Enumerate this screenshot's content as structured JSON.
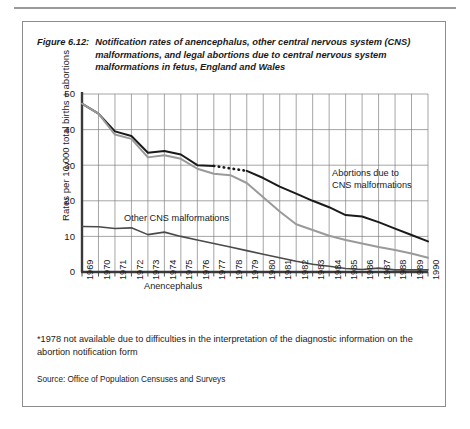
{
  "figure": {
    "label": "Figure 6.12:",
    "caption": "Notification rates of anencephalus, other central nervous system (CNS) malformations, and legal abortions due to central nervous system malformations in fetus, England and Wales",
    "footnote": "*1978 not available due to difficulties in the interpretation of the diagnostic information on the abortion notification form",
    "source": "Source: Office of Population Censuses and Surveys"
  },
  "chart_data": {
    "type": "line",
    "title": "Notification rates of anencephalus, other central nervous system (CNS) malformations, and legal abortions due to central nervous system malformations in fetus, England and Wales",
    "xlabel": "",
    "ylabel": "Rates per 10,000 total births + abortions",
    "x": [
      1969,
      1970,
      1971,
      1972,
      1973,
      1974,
      1975,
      1976,
      1977,
      1978,
      1979,
      1980,
      1981,
      1982,
      1983,
      1984,
      1985,
      1986,
      1987,
      1988,
      1989,
      1990
    ],
    "xtick_labels": [
      "1969",
      "1970",
      "1971",
      "1972",
      "1973",
      "1974",
      "1975",
      "1976",
      "1977",
      "1978",
      "1979",
      "1980",
      "1981",
      "1982",
      "1983",
      "1984",
      "1985",
      "1986",
      "1987",
      "1988",
      "1989",
      "1990"
    ],
    "ytick_labels": [
      "0",
      "10",
      "20",
      "30",
      "40",
      "50"
    ],
    "yticks": [
      0,
      10,
      20,
      30,
      40,
      50
    ],
    "ylim": [
      0,
      50
    ],
    "grid": true,
    "legend_position": "inline-annotations",
    "series": [
      {
        "name": "Abortions due to CNS malformations",
        "color": "#1a1a1a",
        "width": 2.0,
        "label_text": "Abortions due to\nCNS malformations",
        "gap_year": 1978,
        "gap_style": "dotted",
        "values": [
          47.3,
          44.5,
          39.5,
          38.2,
          33.5,
          34.0,
          33.0,
          30.0,
          29.8,
          null,
          28.4,
          26.4,
          24.0,
          22.0,
          20.0,
          18.2,
          16.0,
          15.6,
          14.0,
          12.2,
          10.4,
          8.6
        ]
      },
      {
        "name": "Other CNS malformations",
        "color": "#9a9a9a",
        "width": 2.0,
        "label_text": "Other CNS malformations",
        "values": [
          47.3,
          44.5,
          38.6,
          37.4,
          32.2,
          32.8,
          31.8,
          29.0,
          27.6,
          27.2,
          25.0,
          21.0,
          17.0,
          13.4,
          11.8,
          10.2,
          9.0,
          8.0,
          7.0,
          6.2,
          5.2,
          4.0
        ]
      },
      {
        "name": "Anencephalus",
        "color": "#4a4a4a",
        "width": 1.6,
        "label_text": "Anencephalus",
        "values": [
          12.8,
          12.7,
          12.2,
          12.4,
          10.5,
          11.2,
          10.0,
          9.0,
          8.0,
          7.0,
          6.0,
          5.0,
          4.0,
          3.0,
          2.2,
          1.6,
          1.0,
          0.7,
          1.1,
          0.6,
          0.6,
          0.6
        ]
      }
    ]
  }
}
